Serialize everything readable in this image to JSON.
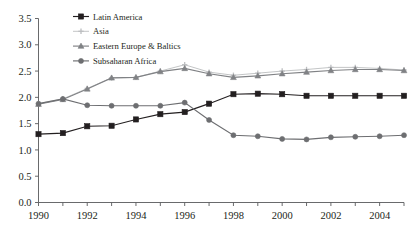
{
  "chart_data": {
    "type": "line",
    "title": "",
    "subtitle": "",
    "xlabel": "",
    "ylabel": "",
    "xlim": [
      1990,
      2005
    ],
    "ylim": [
      0.0,
      3.5
    ],
    "grid": false,
    "legend_position": "top-center",
    "x": [
      1990,
      1991,
      1992,
      1993,
      1994,
      1995,
      1996,
      1997,
      1998,
      1999,
      2000,
      2001,
      2002,
      2003,
      2004,
      2005
    ],
    "ytick_labels": [
      "0.0",
      "0.5",
      "1.0",
      "1.5",
      "2.0",
      "2.5",
      "3.0",
      "3.5"
    ],
    "ytick_values": [
      0.0,
      0.5,
      1.0,
      1.5,
      2.0,
      2.5,
      3.0,
      3.5
    ],
    "xtick_values": [
      1990,
      1991,
      1992,
      1993,
      1994,
      1995,
      1996,
      1997,
      1998,
      1999,
      2000,
      2001,
      2002,
      2003,
      2004,
      2005
    ],
    "xtick_labels": [
      "1990",
      "",
      "1992",
      "",
      "1994",
      "",
      "1996",
      "",
      "1998",
      "",
      "2000",
      "",
      "2002",
      "",
      "2004",
      ""
    ],
    "series": [
      {
        "name": "Latin America",
        "color": "#231f20",
        "marker": "square",
        "values": [
          1.3,
          1.32,
          1.45,
          1.46,
          1.58,
          1.68,
          1.72,
          1.88,
          2.06,
          2.07,
          2.06,
          2.03,
          2.03,
          2.03,
          2.03,
          2.03
        ]
      },
      {
        "name": "Asia",
        "color": "#bcbec0",
        "marker": "plus",
        "values": [
          1.88,
          1.97,
          2.17,
          2.37,
          2.38,
          2.5,
          2.62,
          2.48,
          2.42,
          2.46,
          2.5,
          2.53,
          2.57,
          2.57,
          2.55,
          2.52
        ]
      },
      {
        "name": "Eastern Europe & Baltics",
        "color": "#808285",
        "marker": "triangle",
        "values": [
          1.87,
          1.96,
          2.16,
          2.37,
          2.38,
          2.49,
          2.55,
          2.45,
          2.38,
          2.41,
          2.45,
          2.48,
          2.51,
          2.53,
          2.53,
          2.51
        ]
      },
      {
        "name": "Subsaharan Africa",
        "color": "#6d6e71",
        "marker": "circle",
        "values": [
          1.88,
          1.97,
          1.85,
          1.84,
          1.84,
          1.84,
          1.9,
          1.57,
          1.28,
          1.26,
          1.21,
          1.2,
          1.24,
          1.25,
          1.26,
          1.28
        ]
      }
    ]
  },
  "legend": {
    "entries": [
      {
        "label": "Latin America"
      },
      {
        "label": "Asia"
      },
      {
        "label": "Eastern Europe & Baltics"
      },
      {
        "label": "Subsaharan Africa"
      }
    ]
  }
}
